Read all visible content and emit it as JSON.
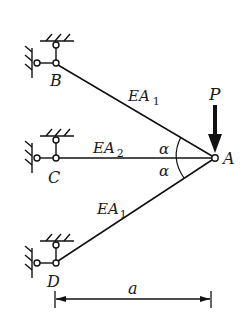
{
  "diagram": {
    "type": "truss",
    "joints": {
      "A": {
        "label": "A",
        "x": 215,
        "y": 158
      },
      "B": {
        "label": "B",
        "x": 56,
        "y": 63
      },
      "C": {
        "label": "C",
        "x": 56,
        "y": 158
      },
      "D": {
        "label": "D",
        "x": 56,
        "y": 263
      }
    },
    "members": [
      {
        "from": "B",
        "to": "A",
        "label_main": "EA",
        "label_sub": "1"
      },
      {
        "from": "C",
        "to": "A",
        "label_main": "EA",
        "label_sub": "2"
      },
      {
        "from": "D",
        "to": "A",
        "label_main": "EA",
        "label_sub": "1"
      }
    ],
    "angles": [
      {
        "label": "α",
        "between": [
          "AB",
          "AC"
        ]
      },
      {
        "label": "α",
        "between": [
          "AC",
          "AD"
        ]
      }
    ],
    "load": {
      "label": "P",
      "direction": "down",
      "at": "A"
    },
    "dimension": {
      "label": "a",
      "from_x": 56,
      "to_x": 211
    }
  }
}
